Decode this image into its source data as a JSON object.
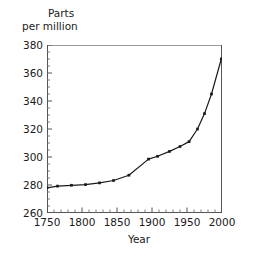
{
  "chart_data": {
    "type": "line",
    "title": "",
    "ylabel": "Parts per million",
    "ylabel_lines": [
      "Parts",
      "per million"
    ],
    "xlabel": "Year",
    "xlim": [
      1750,
      2000
    ],
    "ylim": [
      260,
      380
    ],
    "xticks": [
      1750,
      1800,
      1850,
      1900,
      1950,
      2000
    ],
    "yticks": [
      260,
      280,
      300,
      320,
      340,
      360,
      380
    ],
    "xtick_labels": [
      "1750",
      "1800",
      "1850",
      "1900",
      "1950",
      "2000"
    ],
    "ytick_labels": [
      "260",
      "280",
      "300",
      "320",
      "340",
      "360",
      "380"
    ],
    "x_minor_tick_interval": 10,
    "y_minor_tick_interval": 5,
    "grid": false,
    "legend": null,
    "marker": "square",
    "line_color": "#1a1a1a",
    "marker_color": "#1a1a1a",
    "series": [
      {
        "name": "Carbon dioxide concentration",
        "x": [
          1750,
          1765,
          1785,
          1805,
          1825,
          1845,
          1867,
          1895,
          1908,
          1925,
          1940,
          1953,
          1965,
          1975,
          1985,
          1999
        ],
        "values": [
          278,
          279.2,
          279.8,
          280.3,
          281.5,
          283.2,
          287,
          298.5,
          300.5,
          304,
          307.5,
          311,
          320,
          331,
          345,
          370
        ]
      }
    ]
  },
  "axes": {
    "x_axis_name": "year-axis",
    "y_axis_name": "parts-per-million-axis"
  }
}
